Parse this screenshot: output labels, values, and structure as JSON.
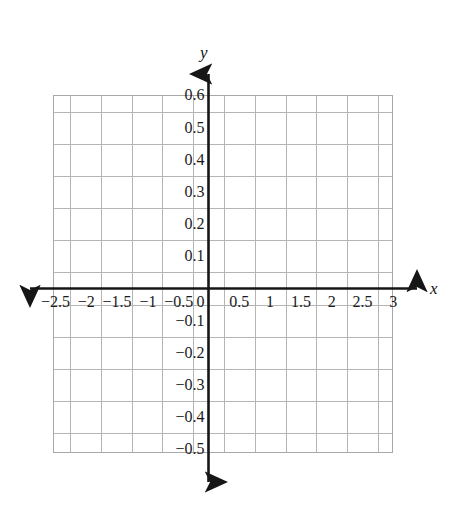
{
  "chart_data": {
    "type": "scatter",
    "title": "",
    "subtitle": "",
    "xlabel": "x",
    "ylabel": "y",
    "xlim": [
      -2.75,
      3.25
    ],
    "ylim": [
      -0.55,
      0.65
    ],
    "grid": true,
    "legend": null,
    "series": [],
    "x": [],
    "values": [],
    "annotations": [],
    "x_ticks": [
      {
        "value": -2.5,
        "label": "−2.5"
      },
      {
        "value": -2,
        "label": "−2"
      },
      {
        "value": -1.5,
        "label": "−1.5"
      },
      {
        "value": -1,
        "label": "−1"
      },
      {
        "value": -0.5,
        "label": "−0.5"
      },
      {
        "value": 0,
        "label": "0"
      },
      {
        "value": 0.5,
        "label": "0.5"
      },
      {
        "value": 1,
        "label": "1"
      },
      {
        "value": 1.5,
        "label": "1.5"
      },
      {
        "value": 2,
        "label": "2"
      },
      {
        "value": 2.5,
        "label": "2.5"
      },
      {
        "value": 3,
        "label": "3"
      }
    ],
    "y_ticks": [
      {
        "value": 0.6,
        "label": "0.6"
      },
      {
        "value": 0.5,
        "label": "0.5"
      },
      {
        "value": 0.4,
        "label": "0.4"
      },
      {
        "value": 0.3,
        "label": "0.3"
      },
      {
        "value": 0.2,
        "label": "0.2"
      },
      {
        "value": 0.1,
        "label": "0.1"
      },
      {
        "value": -0.1,
        "label": "−0.1"
      },
      {
        "value": -0.2,
        "label": "−0.2"
      },
      {
        "value": -0.3,
        "label": "−0.3"
      },
      {
        "value": -0.4,
        "label": "−0.4"
      },
      {
        "value": -0.5,
        "label": "−0.5"
      }
    ],
    "x_gridlines": [
      -2.75,
      -2.25,
      -1.75,
      -1.25,
      -0.75,
      -0.25,
      0.25,
      0.75,
      1.25,
      1.75,
      2.25,
      2.75,
      3.25
    ],
    "y_gridlines": [
      0.65,
      0.55,
      0.45,
      0.35,
      0.25,
      0.15,
      0.05,
      -0.05,
      -0.15,
      -0.25,
      -0.35,
      -0.45,
      -0.55
    ],
    "colors": {
      "background": "#ffffff",
      "grid": "#b5b5b5",
      "axis": "#161616",
      "text": "#1a1a1a"
    }
  },
  "axes": {
    "x_axis_name": "x",
    "y_axis_name": "y",
    "origin_label": "0"
  }
}
